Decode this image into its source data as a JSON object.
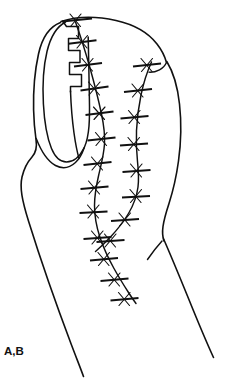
{
  "figure": {
    "panel_label": "A,B",
    "caption_text": "A,B",
    "background_color": "#ffffff",
    "ink_color": "#111111",
    "view": "lateral-oblique",
    "width_px": 236,
    "height_px": 379
  },
  "anatomy": {
    "fingertip_outline": {
      "name": "finger-outline",
      "description": "Distal phalanx soft-tissue contour, apex at upper left, broadening distally toward lower right"
    },
    "fingernail": {
      "name": "fingernail",
      "description": "Elongated oval nail plate on the radial/dorsal aspect, with proximal nail fold crease"
    },
    "nail_fold": {
      "name": "proximal-nail-fold",
      "description": "V-shaped crease at the proximal base of the nail"
    },
    "interdigital_crease": {
      "name": "web-crease",
      "description": "Short oblique crease line on the lower right representing the adjacent digit web"
    },
    "adjacent_digit_edge": {
      "name": "adjacent-digit-edge",
      "description": "Long sweeping contour on the right margin of the drawing"
    }
  },
  "surgical": {
    "zigzag_incision": {
      "name": "zigzag-incision",
      "label": "stepped Z incision along the nail margin",
      "step_count": 5
    },
    "suture_lines": [
      {
        "name": "medial-suture-line",
        "label": "Medial closure line",
        "stitch_count": 13,
        "path_note": "Runs from the apex at top, curves down the midline and continues past the lower edge"
      },
      {
        "name": "lateral-suture-line",
        "label": "Lateral closure line",
        "stitch_count": 8,
        "path_note": "Starts high on the right shoulder, bows laterally then converges with the medial line near the lower midline"
      }
    ],
    "stitch_style": {
      "name": "interrupted-suture",
      "label": "Interrupted suture with knot",
      "render": "short transverse bar crossed by an x-shaped knot"
    }
  }
}
